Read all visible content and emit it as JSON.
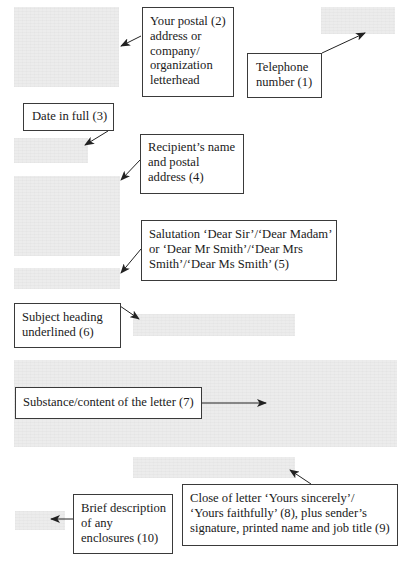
{
  "diagram": {
    "colors": {
      "placeholder_block": "#ececec",
      "box_border": "#3a3a3a",
      "arrow": "#222222",
      "background": "#ffffff"
    },
    "annotations": [
      {
        "id": 1,
        "key": "telephone",
        "lines": [
          "Telephone",
          "number (1)"
        ]
      },
      {
        "id": 2,
        "key": "letterhead",
        "lines": [
          "Your postal (2)",
          "address or",
          "company/",
          "organization",
          "letterhead"
        ]
      },
      {
        "id": 3,
        "key": "date",
        "lines": [
          "Date in full (3)"
        ]
      },
      {
        "id": 4,
        "key": "recipient",
        "lines": [
          "Recipient’s name",
          "and postal",
          "address (4)"
        ]
      },
      {
        "id": 5,
        "key": "salutation",
        "lines": [
          "Salutation ‘Dear Sir’/‘Dear Madam’",
          "or ‘Dear Mr Smith’/‘Dear Mrs",
          "Smith’/‘Dear Ms Smith’ (5)"
        ]
      },
      {
        "id": 6,
        "key": "subject",
        "lines": [
          "Subject heading",
          "underlined (6)"
        ]
      },
      {
        "id": 7,
        "key": "body",
        "lines": [
          "Substance/content of the letter (7)"
        ]
      },
      {
        "id": 8,
        "key": "close",
        "lines": [
          "Close of letter ‘Yours sincerely’/",
          "‘Yours faithfully’ (8), plus sender’s",
          "signature, printed name and job title (9)"
        ]
      },
      {
        "id": 10,
        "key": "enclosures",
        "lines": [
          "Brief description",
          "of any",
          "enclosures (10)"
        ]
      }
    ],
    "placeholder_blocks": [
      {
        "name": "letterhead-block"
      },
      {
        "name": "telephone-block"
      },
      {
        "name": "date-block"
      },
      {
        "name": "recipient-address-block"
      },
      {
        "name": "salutation-block"
      },
      {
        "name": "subject-heading-block"
      },
      {
        "name": "letter-body-block"
      },
      {
        "name": "closing-signature-block"
      },
      {
        "name": "enclosures-block"
      }
    ]
  }
}
